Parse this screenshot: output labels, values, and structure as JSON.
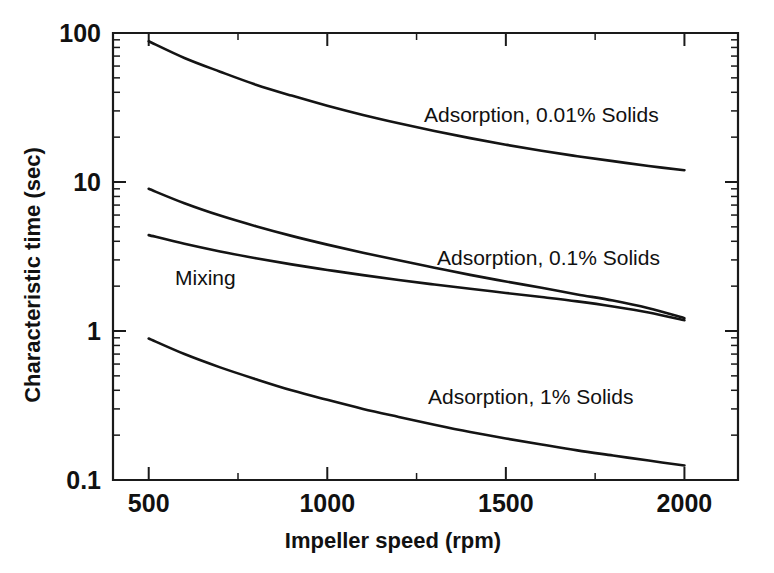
{
  "chart_data": {
    "type": "line",
    "title": "",
    "xlabel": "Impeller speed (rpm)",
    "ylabel": "Characteristic time (sec)",
    "xscale": "linear",
    "yscale": "log",
    "xlim": [
      400,
      2150
    ],
    "ylim": [
      0.1,
      100
    ],
    "grid": false,
    "legend_position": "inline-annotations",
    "xticks": [
      500,
      1000,
      1500,
      2000
    ],
    "xtick_labels": [
      "500",
      "1000",
      "1500",
      "2000"
    ],
    "xminor_ticks": [
      750,
      1250,
      1750
    ],
    "yticks": [
      0.1,
      1,
      10,
      100
    ],
    "ytick_labels": [
      "0.1",
      "1",
      "10",
      "100"
    ],
    "x": [
      500,
      600,
      700,
      800,
      900,
      1000,
      1100,
      1200,
      1300,
      1400,
      1500,
      1600,
      1700,
      1800,
      1900,
      2000
    ],
    "series": [
      {
        "name": "Adsorption, 0.01% Solids",
        "label": "Adsorption, 0.01% Solids",
        "values": [
          88,
          68,
          55,
          45,
          38,
          32.5,
          28.2,
          24.8,
          22.0,
          19.7,
          17.8,
          16.2,
          14.9,
          13.8,
          12.8,
          12.0
        ],
        "start_value": 88,
        "end_value": 12
      },
      {
        "name": "Adsorption, 0.1% Solids",
        "label": "Adsorption, 0.1% Solids",
        "values": [
          9.0,
          7.2,
          5.95,
          5.05,
          4.35,
          3.8,
          3.35,
          2.98,
          2.66,
          2.38,
          2.15,
          1.95,
          1.76,
          1.6,
          1.42,
          1.22
        ],
        "start_value": 9.0,
        "end_value": 1.22
      },
      {
        "name": "Mixing",
        "label": "Mixing",
        "values": [
          4.4,
          3.85,
          3.42,
          3.08,
          2.8,
          2.57,
          2.37,
          2.2,
          2.05,
          1.92,
          1.8,
          1.69,
          1.58,
          1.46,
          1.33,
          1.18
        ],
        "start_value": 4.4,
        "end_value": 1.18
      },
      {
        "name": "Adsorption, 1% Solids",
        "label": "Adsorption, 1% Solids",
        "values": [
          0.89,
          0.7,
          0.57,
          0.475,
          0.4,
          0.345,
          0.3,
          0.265,
          0.235,
          0.21,
          0.19,
          0.173,
          0.158,
          0.146,
          0.135,
          0.125
        ],
        "start_value": 0.89,
        "end_value": 0.125
      }
    ],
    "annotations": [
      {
        "text": "Adsorption, 0.01% Solids",
        "x_px": 424,
        "y_px": 122
      },
      {
        "text": "Adsorption, 0.1% Solids",
        "x_px": 437,
        "y_px": 265
      },
      {
        "text": "Mixing",
        "x_px": 175,
        "y_px": 285
      },
      {
        "text": "Adsorption, 1% Solids",
        "x_px": 428,
        "y_px": 404
      }
    ]
  },
  "axes": {
    "y_title": "Characteristic time (sec)",
    "x_title": "Impeller speed (rpm)",
    "y_tick_labels": [
      "100",
      "10",
      "1",
      "0.1"
    ],
    "x_tick_labels": [
      "500",
      "1000",
      "1500",
      "2000"
    ]
  },
  "colors": {
    "line": "#141414",
    "axis": "#1a1a1a",
    "background": "#ffffff",
    "text": "#111111"
  }
}
